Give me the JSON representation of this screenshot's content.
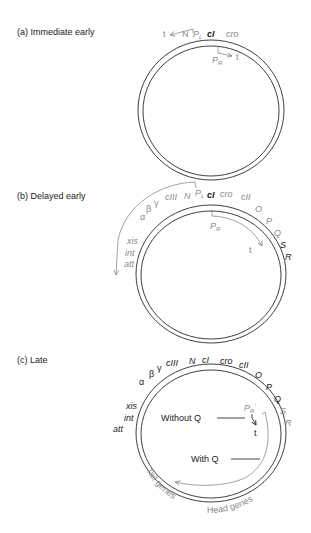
{
  "panels": {
    "a": {
      "title": "(a)  Immediate early",
      "labels": {
        "t_left": "t",
        "N": "N",
        "PL": "P",
        "PL_sub": "L",
        "cI": "cI",
        "cro": "cro",
        "PR": "P",
        "PR_sub": "R",
        "t_right": "t"
      }
    },
    "b": {
      "title": "(b)  Delayed early",
      "labels": {
        "cIII": "cIII",
        "N": "N",
        "PL": "P",
        "PL_sub": "L",
        "cI": "cI",
        "cro": "cro",
        "cII": "cII",
        "O": "O",
        "P": "P",
        "Q": "Q",
        "S": "S",
        "R": "R",
        "gamma": "γ",
        "beta": "β",
        "alpha": "α",
        "xis": "xis",
        "int": "int",
        "att": "att",
        "PR": "P",
        "PR_sub": "R",
        "t": "t"
      }
    },
    "c": {
      "title": "(c)  Late",
      "labels": {
        "cIII": "cIII",
        "N": "N",
        "cI": "cI",
        "cro": "cro",
        "cII": "cII",
        "O": "O",
        "P": "P",
        "Q": "Q",
        "S": "S",
        "R": "R",
        "gamma": "γ",
        "beta": "β",
        "alpha": "α",
        "xis": "xis",
        "int": "int",
        "att": "att",
        "PR_prime": "P",
        "PR_prime_sub": "R",
        "PR_prime_mark": "'",
        "t": "t",
        "without_q": "Without Q",
        "with_q": "With Q",
        "tail_genes": "Tail genes",
        "head_genes": "Head genes"
      }
    }
  },
  "colors": {
    "black_text": "#1a1a1a",
    "gray_text": "#8a8a8a",
    "ring": "#2a2a2a",
    "background": "#ffffff"
  }
}
